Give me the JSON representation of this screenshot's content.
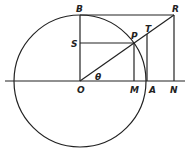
{
  "diagram": {
    "circle": {
      "cx": 80,
      "cy": 81,
      "r": 66
    },
    "axis": {
      "x1": 5,
      "x2": 185,
      "y": 81
    },
    "points": {
      "O": {
        "x": 80,
        "y": 81
      },
      "B": {
        "x": 80,
        "y": 15
      },
      "R": {
        "x": 174,
        "y": 15
      },
      "P": {
        "x": 134,
        "y": 43
      },
      "S": {
        "x": 80,
        "y": 43
      },
      "M": {
        "x": 134,
        "y": 81
      },
      "A": {
        "x": 146,
        "y": 81
      },
      "N": {
        "x": 174,
        "y": 81
      },
      "T": {
        "x": 147,
        "y": 34
      }
    },
    "labels": {
      "B": "B",
      "R": "R",
      "T": "T",
      "P": "P",
      "S": "S",
      "O": "O",
      "M": "M",
      "A": "A",
      "N": "N",
      "theta": "θ"
    }
  }
}
